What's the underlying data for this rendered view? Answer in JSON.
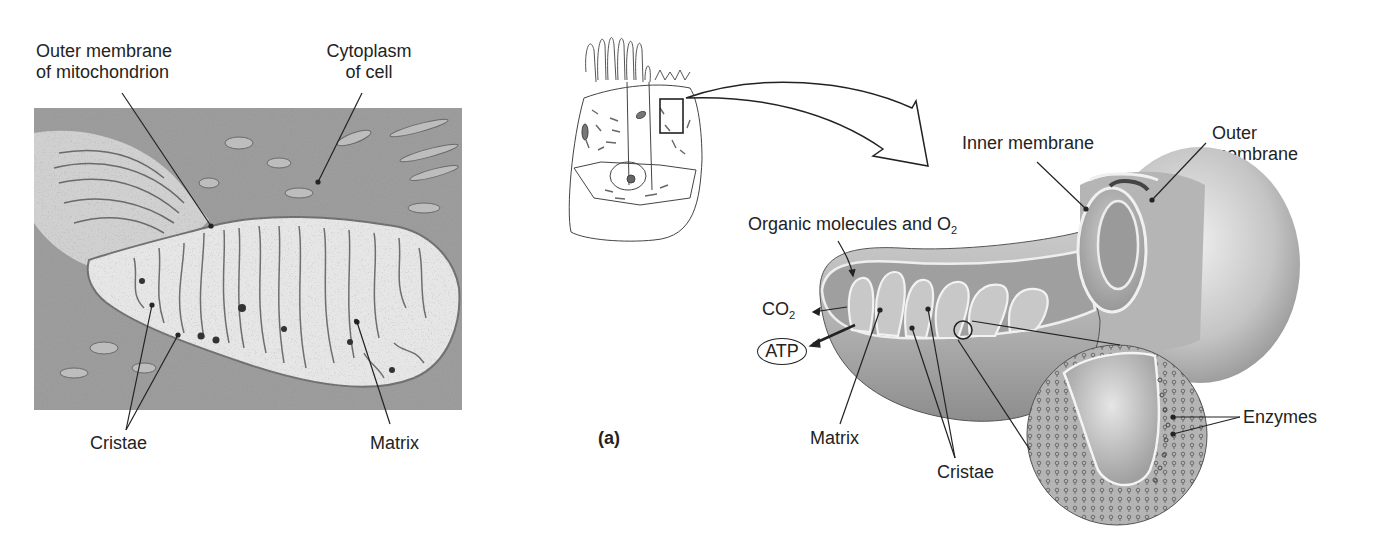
{
  "figure": {
    "panel_label": "(a)",
    "micrograph": {
      "description": "Electron micrograph of a mitochondrion within cell cytoplasm",
      "labels": {
        "outer_membrane_line1": "Outer membrane",
        "outer_membrane_line2": "of mitochondrion",
        "cytoplasm_line1": "Cytoplasm",
        "cytoplasm_line2": "of cell",
        "cristae": "Cristae",
        "matrix": "Matrix"
      }
    },
    "cell_sketch": {
      "description": "Sketch of an epithelial cell with a boxed region containing a mitochondrion, arrow pointing to enlarged cutaway"
    },
    "cutaway": {
      "labels": {
        "inner_membrane": "Inner membrane",
        "outer_membrane_line1": "Outer",
        "outer_membrane_line2": "membrane",
        "organic_molecules": "Organic molecules and O",
        "organic_molecules_sub": "2",
        "co2": "CO",
        "co2_sub": "2",
        "atp": "ATP",
        "matrix": "Matrix",
        "cristae": "Cristae",
        "enzymes": "Enzymes"
      }
    }
  },
  "colors": {
    "ink": "#232323",
    "micrograph_dark": "#5a5a5a",
    "micrograph_light": "#d8d8d8",
    "mito_shade": "#a8a8a8",
    "mito_light": "#e2e2e2"
  }
}
